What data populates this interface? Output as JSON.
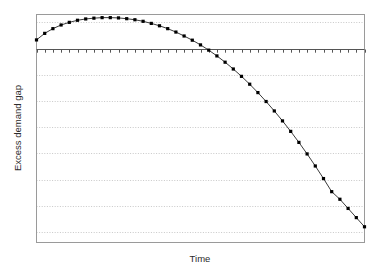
{
  "chart_data": {
    "type": "line",
    "title": "",
    "xlabel": "Time",
    "ylabel": "Excess demand gap",
    "grid": true,
    "legend": null,
    "xlim": [
      0,
      40
    ],
    "ylim": [
      -7.4,
      1.3
    ],
    "yzero_line": 0,
    "series": [
      {
        "name": "Excess demand gap",
        "marker": "filled-square",
        "line_color": "#3a3a3a",
        "marker_color": "#000000",
        "x": [
          0,
          1,
          2,
          3,
          4,
          5,
          6,
          7,
          8,
          9,
          10,
          11,
          12,
          13,
          14,
          15,
          16,
          17,
          18,
          19,
          20,
          21,
          22,
          23,
          24,
          25,
          26,
          27,
          28,
          29,
          30,
          31,
          32,
          33,
          34,
          35,
          36,
          37,
          38,
          39,
          40
        ],
        "values": [
          0.33,
          0.58,
          0.76,
          0.9,
          1.0,
          1.08,
          1.13,
          1.16,
          1.18,
          1.18,
          1.17,
          1.14,
          1.1,
          1.04,
          0.96,
          0.87,
          0.76,
          0.63,
          0.48,
          0.32,
          0.14,
          -0.06,
          -0.28,
          -0.52,
          -0.78,
          -1.06,
          -1.36,
          -1.68,
          -2.02,
          -2.38,
          -2.76,
          -3.16,
          -3.58,
          -4.02,
          -4.48,
          -4.96,
          -5.46,
          -5.75,
          -6.1,
          -6.45,
          -6.8
        ]
      }
    ],
    "ytick_values": [
      1.0,
      0,
      -1.0,
      -2.0,
      -3.0,
      -4.0,
      -5.0,
      -6.0,
      -7.0
    ],
    "ytick_labels": [
      "",
      "",
      "",
      "",
      "",
      "",
      "",
      "",
      ""
    ],
    "xtick_labels": [],
    "xtick_count": 41,
    "colors": {
      "frame": "#9a9a9a",
      "grid": "#c8c8c8",
      "zero_axis": "#555555",
      "line": "#3a3a3a",
      "marker": "#000000",
      "text": "#2b2b2b",
      "background": "#ffffff"
    }
  }
}
